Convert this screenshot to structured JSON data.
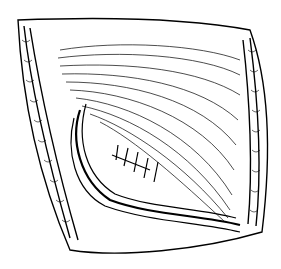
{
  "illustration": {
    "subject": "surgical-incision-line-drawing",
    "colors": {
      "ink": "#000000",
      "background": "#ffffff"
    },
    "elements": [
      "skin-edge",
      "muscle-fibers",
      "sutures",
      "wound-margin"
    ]
  }
}
